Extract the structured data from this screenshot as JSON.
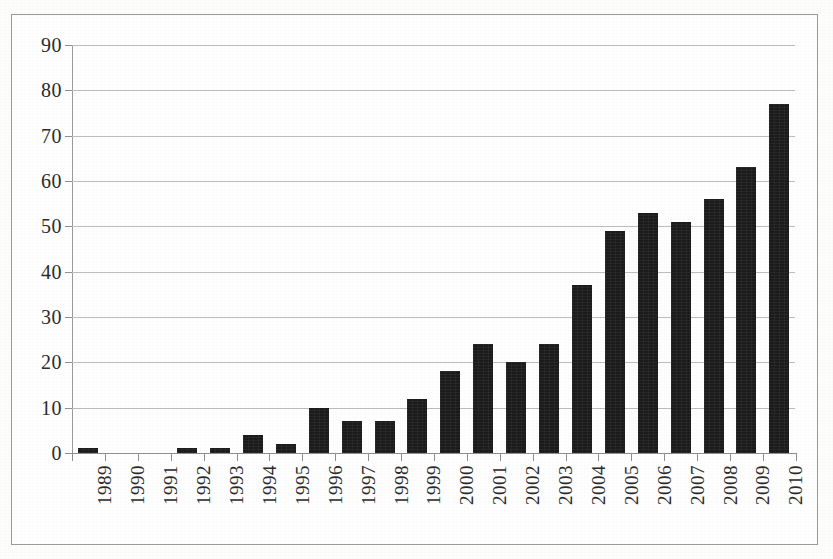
{
  "chart_data": {
    "type": "bar",
    "title": "",
    "subtitle": "",
    "xlabel": "",
    "ylabel": "",
    "ylim": [
      0,
      90
    ],
    "ytick_step": 10,
    "ytick_labels": [
      "0",
      "10",
      "20",
      "30",
      "40",
      "50",
      "60",
      "70",
      "80",
      "90"
    ],
    "grid": true,
    "legend": null,
    "legend_position": "none",
    "bar_color": "#1b1b1b",
    "gridline_color": "#bdbdbd",
    "axis_color": "#8f8f8f",
    "frame_color": "#9a9a9a",
    "background_color": "#fefefe",
    "xlabel_rotation_degrees": 90,
    "categories": [
      "1989",
      "1990",
      "1991",
      "1992",
      "1993",
      "1994",
      "1995",
      "1996",
      "1997",
      "1998",
      "1999",
      "2000",
      "2001",
      "2002",
      "2003",
      "2004",
      "2005",
      "2006",
      "2007",
      "2008",
      "2009",
      "2010"
    ],
    "values": [
      1,
      0,
      0,
      1,
      1,
      4,
      2,
      10,
      7,
      7,
      12,
      18,
      24,
      20,
      24,
      37,
      49,
      53,
      51,
      56,
      63,
      77
    ]
  }
}
